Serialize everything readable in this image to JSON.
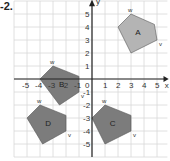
{
  "question_number": "-2.",
  "axes": {
    "x_label": "x",
    "y_label": "y",
    "x_ticks": [
      "-5",
      "-4",
      "-3",
      "-2",
      "-1",
      "1",
      "2",
      "3",
      "4",
      "5"
    ],
    "y_ticks": [
      "-5",
      "-4",
      "-3",
      "-2",
      "-1",
      "1",
      "2",
      "3",
      "4",
      "5"
    ],
    "origin_label": "0",
    "x_range": [
      -6,
      5.8
    ],
    "y_range": [
      -5.8,
      6
    ]
  },
  "colors": {
    "grid": "#d8d8d8",
    "axis": "#222222",
    "shape_A": "#b4b4b4",
    "shape_other": "#7c7c7c",
    "outline": "#555555"
  },
  "shapes": [
    {
      "name": "A",
      "label": "A",
      "vertices": [
        [
          3,
          5
        ],
        [
          4.8,
          4.2
        ],
        [
          5,
          3
        ],
        [
          3,
          2
        ],
        [
          2,
          4
        ]
      ],
      "w": [
        3,
        5
      ],
      "v": [
        5,
        3
      ]
    },
    {
      "name": "B",
      "label": "B",
      "vertices": [
        [
          -3,
          1
        ],
        [
          -1,
          0.2
        ],
        [
          -1,
          -1
        ],
        [
          -2.5,
          -2
        ],
        [
          -4,
          0
        ]
      ],
      "w": [
        -3,
        1
      ],
      "v": [
        -1,
        -1
      ]
    },
    {
      "name": "C",
      "label": "C",
      "vertices": [
        [
          1,
          -2
        ],
        [
          3,
          -2.8
        ],
        [
          3,
          -4
        ],
        [
          1,
          -5
        ],
        [
          0,
          -3
        ]
      ],
      "w": [
        1,
        -2
      ],
      "v": [
        3,
        -4
      ]
    },
    {
      "name": "D",
      "label": "D",
      "vertices": [
        [
          -4,
          -2
        ],
        [
          -2,
          -2.8
        ],
        [
          -2,
          -4
        ],
        [
          -3.8,
          -5
        ],
        [
          -5,
          -3
        ]
      ],
      "w": [
        -4,
        -2
      ],
      "v": [
        -2,
        -4
      ]
    }
  ],
  "vertex_labels": {
    "w": "w",
    "v": "v"
  }
}
